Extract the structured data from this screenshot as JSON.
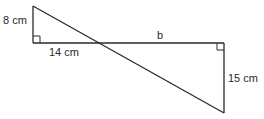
{
  "diagram": {
    "type": "similar-triangles",
    "stroke_color": "#2a2a2a",
    "background": "#ffffff",
    "labels": {
      "left_vertical": "8 cm",
      "bottom_left_horizontal": "14 cm",
      "top_right_horizontal": "b",
      "right_vertical": "15 cm"
    },
    "right_angle_markers": [
      "bottom-left-corner",
      "top-right-corner"
    ]
  }
}
